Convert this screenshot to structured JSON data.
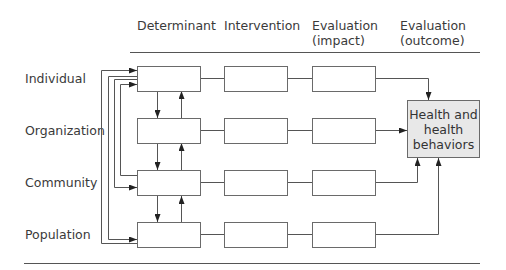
{
  "header": {
    "columns": [
      {
        "label": "Determinant"
      },
      {
        "label": "Intervention"
      },
      {
        "label": "Evaluation\n(impact)",
        "line1": "Evaluation",
        "line2": "(impact)"
      },
      {
        "label": "Evaluation\n(outcome)",
        "line1": "Evaluation",
        "line2": "(outcome)"
      }
    ]
  },
  "rows": [
    {
      "label": "Individual"
    },
    {
      "label": "Organization"
    },
    {
      "label": "Community"
    },
    {
      "label": "Population"
    }
  ],
  "outcome_box": {
    "line1": "Health and",
    "line2": "health",
    "line3": "behaviors",
    "fill": "#e8e8e8"
  },
  "colors": {
    "line": "#555555",
    "box_border": "#6a6a6a",
    "text": "#3a3a3a"
  }
}
